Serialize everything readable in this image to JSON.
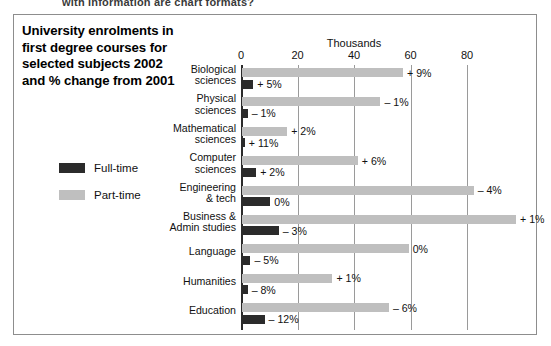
{
  "clipped_header_text": "with information are chart formats?",
  "title_lines": [
    "University enrolments in",
    "first degree courses for",
    "selected subjects 2002",
    "and % change from 2001"
  ],
  "legend": {
    "items": [
      {
        "label": "Full-time",
        "color": "#2b2b2b",
        "key": "full_time"
      },
      {
        "label": "Part-time",
        "color": "#bfbfbf",
        "key": "part_time"
      }
    ]
  },
  "axis": {
    "title": "Thousands",
    "ticks": [
      0,
      20,
      40,
      60,
      80
    ],
    "tick_labels": [
      "0",
      "20",
      "40",
      "60",
      "80"
    ]
  },
  "chart_data": {
    "type": "bar",
    "orientation": "horizontal",
    "title": "University enrolments in first degree courses for selected subjects 2002 and % change from 2001",
    "xlabel": "Thousands",
    "ylabel": "",
    "xlim": [
      0,
      105
    ],
    "grid": true,
    "legend_position": "left",
    "categories": [
      "Biological sciences",
      "Physical sciences",
      "Mathematical sciences",
      "Computer sciences",
      "Engineering & tech",
      "Business & Admin studies",
      "Language",
      "Humanities",
      "Education"
    ],
    "category_label_lines": [
      [
        "Biological",
        "sciences"
      ],
      [
        "Physical",
        "sciences"
      ],
      [
        "Mathematical",
        "sciences"
      ],
      [
        "Computer",
        "sciences"
      ],
      [
        "Engineering",
        "& tech"
      ],
      [
        "Business &",
        "Admin studies"
      ],
      [
        "Language"
      ],
      [
        "Humanities"
      ],
      [
        "Education"
      ]
    ],
    "series": [
      {
        "name": "Part-time",
        "color": "#bfbfbf",
        "values": [
          57,
          49,
          16,
          41,
          82,
          97,
          59,
          32,
          52
        ],
        "change_labels": [
          "+ 9%",
          "– 1%",
          "+ 2%",
          "+ 6%",
          "– 4%",
          "+ 1%",
          "0%",
          "+ 1%",
          "– 6%"
        ]
      },
      {
        "name": "Full-time",
        "color": "#2b2b2b",
        "values": [
          4,
          2,
          1,
          5,
          10,
          13,
          3,
          2,
          8
        ],
        "change_labels": [
          "+ 5%",
          "– 1%",
          "+ 11%",
          "+ 2%",
          "0%",
          "– 3%",
          "– 5%",
          "– 8%",
          "– 12%"
        ]
      }
    ]
  }
}
